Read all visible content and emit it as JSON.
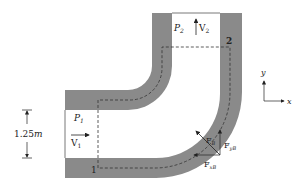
{
  "diagram": {
    "colors": {
      "pipe_wall": "#8a8a8a",
      "background": "#ffffff",
      "line": "#222222",
      "control_volume": "#333333"
    },
    "labels": {
      "p1": "P",
      "p1_sub": "1",
      "v1": "V",
      "v1_sub": "1",
      "p2": "P",
      "p2_sub": "2",
      "v2": "V",
      "v2_sub": "2",
      "section1": "1",
      "section2": "2",
      "dimension": "1.25",
      "dimension_unit": "m",
      "fb": "F",
      "fb_sub": "B",
      "fxb": "F",
      "fxb_sub": "xB",
      "fyb": "F",
      "fyb_sub": "yB",
      "axis_x": "x",
      "axis_y": "y"
    }
  }
}
